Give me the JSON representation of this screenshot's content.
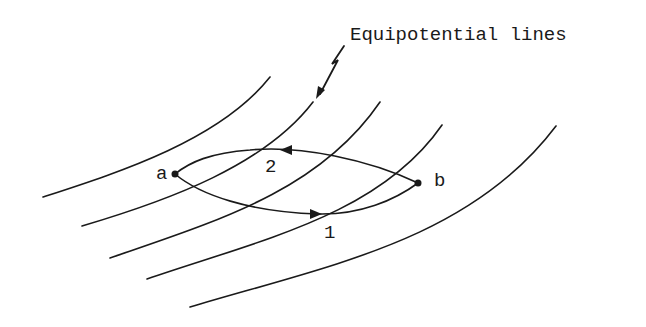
{
  "diagram": {
    "annotation": "Equipotential lines",
    "points": [
      {
        "label": "a",
        "x": 175,
        "y": 174
      },
      {
        "label": "b",
        "x": 418,
        "y": 183
      }
    ],
    "paths": [
      {
        "label": "1",
        "from": "a",
        "to": "b",
        "direction": "a to b (lower path)"
      },
      {
        "label": "2",
        "from": "b",
        "to": "a",
        "direction": "b to a (upper path)"
      }
    ],
    "equipotential_line_count": 5,
    "colors": {
      "ink": "#1a1a1a",
      "background": "#ffffff"
    }
  }
}
